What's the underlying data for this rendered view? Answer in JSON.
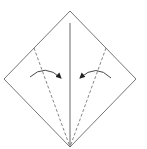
{
  "diagram": {
    "type": "origami-fold-step",
    "colors": {
      "line": "#555555",
      "background": "#ffffff"
    },
    "square": {
      "top": [
        70,
        11
      ],
      "right": [
        136,
        79
      ],
      "bottom": [
        70,
        147
      ],
      "left": [
        4,
        79
      ]
    },
    "center_crease": {
      "from": [
        70,
        23
      ],
      "to": [
        70,
        147
      ],
      "style": "solid"
    },
    "valley_folds": [
      {
        "name": "left-valley-fold",
        "from": [
          34,
          48
        ],
        "to": [
          70,
          147
        ],
        "style": "dashed"
      },
      {
        "name": "right-valley-fold",
        "from": [
          106,
          48
        ],
        "to": [
          70,
          147
        ],
        "style": "dashed"
      }
    ],
    "arrows": [
      {
        "name": "left-fold-arrow",
        "direction": "right"
      },
      {
        "name": "right-fold-arrow",
        "direction": "left"
      }
    ]
  }
}
